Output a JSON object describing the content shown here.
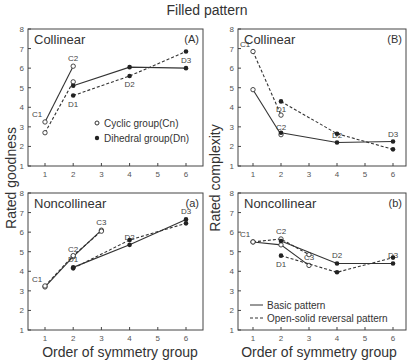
{
  "title": "Filled pattern",
  "labels": {
    "ylabel_left": "Rated goodness",
    "ylabel_right": "Rated complexity",
    "xlabel": "Order of symmetry group"
  },
  "legends": {
    "markers": [
      {
        "marker": "open-circle",
        "label": "Cyclic group(Cn)"
      },
      {
        "marker": "filled-circle",
        "label": "Dihedral group(Dn)"
      }
    ],
    "lines": [
      {
        "style": "solid",
        "label": "Basic pattern"
      },
      {
        "style": "dashed",
        "label": "Open-solid reversal pattern"
      }
    ]
  },
  "chart_data": [
    {
      "type": "line",
      "panel": "(A)",
      "title": "Collinear",
      "xlabel": "Order of symmetry group",
      "ylabel": "Rated goodness",
      "xticks": [
        1,
        2,
        3,
        4,
        5,
        6
      ],
      "yticks": [
        1,
        2,
        3,
        4,
        5,
        6,
        7,
        8
      ],
      "ylim": [
        1,
        8
      ],
      "legend": [
        "Cyclic group(Cn)",
        "Dihedral group(Dn)"
      ],
      "series": [
        {
          "name": "Cyclic basic",
          "group": "C",
          "style": "solid",
          "x": [
            1,
            2
          ],
          "values": [
            3.25,
            6.1
          ],
          "labels": [
            "C1",
            "C2"
          ]
        },
        {
          "name": "Cyclic reversal",
          "group": "C",
          "style": "dashed",
          "x": [
            1,
            2
          ],
          "values": [
            2.7,
            5.3
          ],
          "labels": [
            "",
            ""
          ]
        },
        {
          "name": "Dihedral basic",
          "group": "D",
          "style": "solid",
          "x": [
            2,
            4,
            6
          ],
          "values": [
            5.1,
            6.05,
            6.0
          ],
          "labels": [
            "",
            "",
            ""
          ]
        },
        {
          "name": "Dihedral reversal",
          "group": "D",
          "style": "dashed",
          "x": [
            2,
            4,
            6
          ],
          "values": [
            4.6,
            5.6,
            6.85
          ],
          "labels": [
            "D1",
            "D2",
            "D3"
          ]
        }
      ]
    },
    {
      "type": "line",
      "panel": "(B)",
      "title": "Collinear",
      "xlabel": "Order of symmetry group",
      "ylabel": "Rated complexity",
      "xticks": [
        1,
        2,
        3,
        4,
        5,
        6
      ],
      "yticks": [
        1,
        2,
        3,
        4,
        5,
        6,
        7,
        8
      ],
      "ylim": [
        1,
        8
      ],
      "series": [
        {
          "name": "Cyclic basic",
          "group": "C",
          "style": "solid",
          "x": [
            1,
            2
          ],
          "values": [
            4.9,
            2.6
          ],
          "labels": [
            "",
            "C2"
          ]
        },
        {
          "name": "Cyclic reversal",
          "group": "C",
          "style": "dashed",
          "x": [
            1,
            2
          ],
          "values": [
            6.85,
            3.6
          ],
          "labels": [
            "C1",
            ""
          ]
        },
        {
          "name": "Dihedral basic",
          "group": "D",
          "style": "solid",
          "x": [
            2,
            4,
            6
          ],
          "values": [
            2.7,
            2.2,
            2.25
          ],
          "labels": [
            "",
            "D2",
            "D3"
          ]
        },
        {
          "name": "Dihedral reversal",
          "group": "D",
          "style": "dashed",
          "x": [
            2,
            4,
            6
          ],
          "values": [
            4.3,
            2.65,
            1.85
          ],
          "labels": [
            "D1",
            "",
            ""
          ]
        }
      ]
    },
    {
      "type": "line",
      "panel": "(a)",
      "title": "Noncollinear",
      "xlabel": "Order of symmetry group",
      "ylabel": "Rated goodness",
      "xticks": [
        1,
        2,
        3,
        4,
        5,
        6
      ],
      "yticks": [
        1,
        2,
        3,
        4,
        5,
        6,
        7,
        8
      ],
      "ylim": [
        1,
        8
      ],
      "series": [
        {
          "name": "Cyclic basic",
          "group": "C",
          "style": "solid",
          "x": [
            1,
            2,
            3
          ],
          "values": [
            3.2,
            4.75,
            6.1
          ],
          "labels": [
            "C1",
            "C2",
            "C3"
          ]
        },
        {
          "name": "Cyclic reversal",
          "group": "C",
          "style": "dashed",
          "x": [
            1,
            2,
            3
          ],
          "values": [
            3.25,
            4.8,
            6.05
          ],
          "labels": [
            "",
            "",
            ""
          ]
        },
        {
          "name": "Dihedral basic",
          "group": "D",
          "style": "solid",
          "x": [
            2,
            4,
            6
          ],
          "values": [
            4.2,
            5.35,
            6.65
          ],
          "labels": [
            "D1",
            "D2",
            "D3"
          ]
        },
        {
          "name": "Dihedral reversal",
          "group": "D",
          "style": "dashed",
          "x": [
            2,
            4,
            6
          ],
          "values": [
            4.15,
            5.6,
            6.45
          ],
          "labels": [
            "",
            "",
            ""
          ]
        }
      ]
    },
    {
      "type": "line",
      "panel": "(b)",
      "title": "Noncollinear",
      "xlabel": "Order of symmetry group",
      "ylabel": "Rated complexity",
      "xticks": [
        1,
        2,
        3,
        4,
        5,
        6
      ],
      "yticks": [
        1,
        2,
        3,
        4,
        5,
        6,
        7,
        8
      ],
      "ylim": [
        1,
        8
      ],
      "legend": [
        "Basic pattern",
        "Open-solid reversal pattern"
      ],
      "series": [
        {
          "name": "Cyclic basic",
          "group": "C",
          "style": "solid",
          "x": [
            1,
            2,
            3
          ],
          "values": [
            5.5,
            5.35,
            4.3
          ],
          "labels": [
            "C1",
            "",
            "C3"
          ]
        },
        {
          "name": "Cyclic reversal",
          "group": "C",
          "style": "dashed",
          "x": [
            1,
            2,
            3
          ],
          "values": [
            5.5,
            5.65,
            4.85
          ],
          "labels": [
            "",
            "C2",
            ""
          ]
        },
        {
          "name": "Dihedral basic",
          "group": "D",
          "style": "solid",
          "x": [
            2,
            4,
            6
          ],
          "values": [
            5.55,
            4.4,
            4.4
          ],
          "labels": [
            "",
            "D2",
            "D3"
          ]
        },
        {
          "name": "Dihedral reversal",
          "group": "D",
          "style": "dashed",
          "x": [
            2,
            4,
            6
          ],
          "values": [
            4.8,
            3.95,
            4.7
          ],
          "labels": [
            "D1",
            "",
            ""
          ]
        }
      ]
    }
  ]
}
